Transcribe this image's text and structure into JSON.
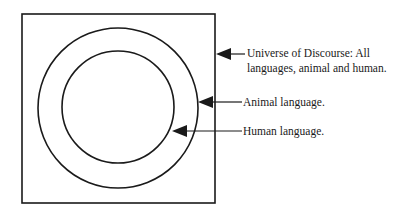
{
  "diagram": {
    "type": "venn-nested",
    "universe": {
      "label_line1": "Universe of Discourse: All",
      "label_line2": "languages, animal and human."
    },
    "outer_set": {
      "label": "Animal language."
    },
    "inner_set": {
      "label": "Human language."
    },
    "colors": {
      "stroke": "#1a1a1a",
      "background": "#ffffff"
    }
  }
}
